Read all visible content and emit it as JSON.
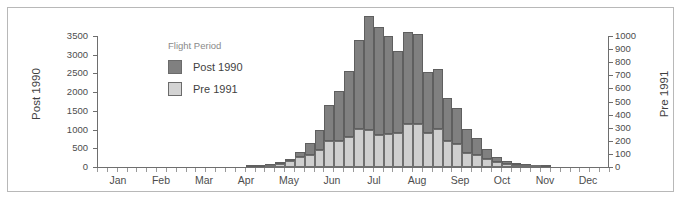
{
  "chart_data": {
    "type": "bar",
    "title": "",
    "subtitle": "",
    "stacked": true,
    "grid": false,
    "xlabel": "",
    "x_tick_labels": [
      "Jan",
      "Feb",
      "Mar",
      "Apr",
      "May",
      "Jun",
      "Jul",
      "Aug",
      "Sep",
      "Oct",
      "Nov",
      "Dec"
    ],
    "x_minor_ticks": "weekly (52 bins across the year)",
    "axes": [
      {
        "id": "left",
        "label": "Post 1990",
        "position": "left",
        "ylim": [
          0,
          3500
        ],
        "tick_step": 500,
        "ticks": [
          0,
          500,
          1000,
          1500,
          2000,
          2500,
          3000,
          3500
        ],
        "tick_labels": [
          "0",
          "500",
          "1000",
          "1500",
          "2000",
          "2500",
          "3000",
          "3500"
        ]
      },
      {
        "id": "right",
        "label": "Pre 1991",
        "position": "right",
        "ylim": [
          0,
          1000
        ],
        "tick_step": 100,
        "ticks": [
          0,
          100,
          200,
          300,
          400,
          500,
          600,
          700,
          800,
          900,
          1000
        ],
        "tick_labels": [
          "0",
          "100",
          "200",
          "300",
          "400",
          "500",
          "600",
          "700",
          "800",
          "900",
          "1000"
        ]
      }
    ],
    "legend": {
      "title": "Flight Period",
      "position": "upper-left-inside",
      "entries": [
        {
          "name": "Post 1990",
          "color": "#808080",
          "axis": "left"
        },
        {
          "name": "Pre 1991",
          "color": "#d3d3d3",
          "axis": "right"
        }
      ]
    },
    "categories": [
      "W1",
      "W2",
      "W3",
      "W4",
      "W5",
      "W6",
      "W7",
      "W8",
      "W9",
      "W10",
      "W11",
      "W12",
      "W13",
      "W14",
      "W15",
      "W16",
      "W17",
      "W18",
      "W19",
      "W20",
      "W21",
      "W22",
      "W23",
      "W24",
      "W25",
      "W26",
      "W27",
      "W28",
      "W29",
      "W30",
      "W31",
      "W32",
      "W33",
      "W34",
      "W35",
      "W36",
      "W37",
      "W38",
      "W39",
      "W40",
      "W41",
      "W42",
      "W43",
      "W44",
      "W45",
      "W46",
      "W47",
      "W48",
      "W49",
      "W50",
      "W51",
      "W52"
    ],
    "series": [
      {
        "name": "Post 1990",
        "color": "#808080",
        "axis": "left",
        "values": [
          0,
          0,
          0,
          0,
          0,
          0,
          0,
          0,
          0,
          0,
          0,
          0,
          0,
          0,
          0,
          10,
          15,
          25,
          45,
          70,
          150,
          320,
          540,
          980,
          1330,
          1760,
          2380,
          3050,
          2880,
          2630,
          2180,
          2440,
          2430,
          1620,
          1600,
          1170,
          960,
          660,
          440,
          250,
          130,
          70,
          40,
          20,
          10,
          5,
          0,
          0,
          0,
          0,
          0,
          0
        ]
      },
      {
        "name": "Pre 1991",
        "color": "#d3d3d3",
        "axis": "right",
        "values": [
          0,
          0,
          0,
          0,
          0,
          0,
          0,
          0,
          0,
          0,
          0,
          0,
          0,
          0,
          0,
          0,
          0,
          5,
          20,
          45,
          75,
          95,
          130,
          195,
          200,
          230,
          290,
          285,
          245,
          250,
          260,
          330,
          325,
          260,
          290,
          195,
          175,
          105,
          95,
          65,
          40,
          25,
          12,
          6,
          3,
          0,
          0,
          0,
          0,
          0,
          0,
          0
        ]
      }
    ]
  },
  "colors": {
    "post_1990": "#808080",
    "pre_1991": "#d3d3d3",
    "bar_outline": "#5f5f5f",
    "axis": "#6e6e6e",
    "text": "#4d4d4d",
    "frame_border": "#b8b8b8",
    "background": "#ffffff",
    "legend_title": "#8a8a8a"
  }
}
